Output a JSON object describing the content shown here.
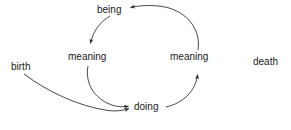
{
  "diagram": {
    "background_color": "#ffffff",
    "stroke_color": "#333333",
    "text_color": "#1a1a1a",
    "nodes": [
      {
        "id": "being",
        "label": "being"
      },
      {
        "id": "meaning-left",
        "label": "meaning"
      },
      {
        "id": "meaning-right",
        "label": "meaning"
      },
      {
        "id": "doing",
        "label": "doing"
      },
      {
        "id": "birth",
        "label": "birth"
      },
      {
        "id": "death",
        "label": "death"
      }
    ],
    "edges": [
      {
        "id": "being-to-meaning-left",
        "from": "being",
        "to": "meaning-left",
        "arrow": "down"
      },
      {
        "id": "meaning-left-to-doing",
        "from": "meaning-left",
        "to": "doing",
        "arrow": "down-right"
      },
      {
        "id": "doing-to-meaning-right",
        "from": "doing",
        "to": "meaning-right",
        "arrow": "up"
      },
      {
        "id": "meaning-right-to-being",
        "from": "meaning-right",
        "to": "being",
        "arrow": "left"
      },
      {
        "id": "birth-to-doing",
        "from": "birth",
        "to": "doing",
        "arrow": "right"
      }
    ]
  }
}
